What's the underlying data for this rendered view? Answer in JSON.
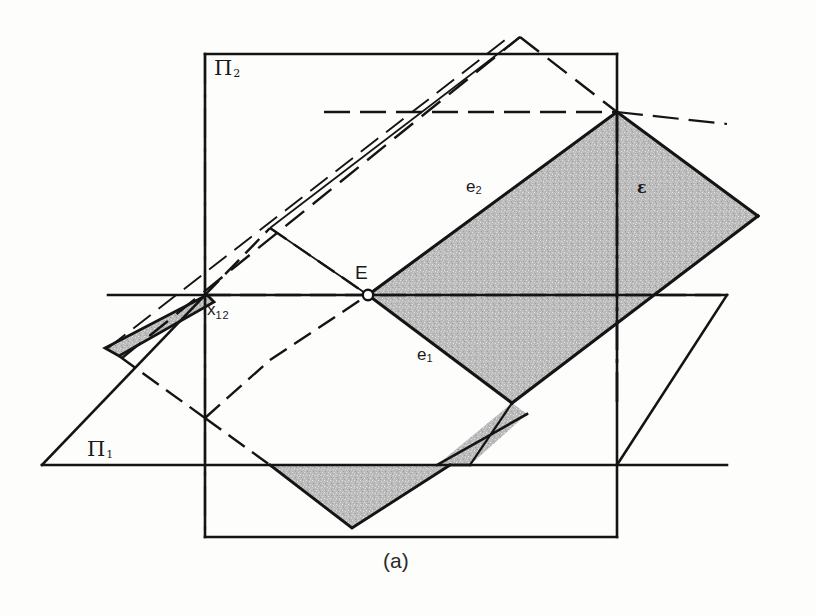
{
  "figure": {
    "caption": "(a)",
    "background_color": "#fdfdfc",
    "ink_color": "#141414",
    "shade_color": "#c9c9c9"
  },
  "labels": {
    "plane_pi2": {
      "base": "Π",
      "sub": "2"
    },
    "plane_pi1": {
      "base": "Π",
      "sub": "1"
    },
    "axis_x12": {
      "base": "x",
      "sub": "12"
    },
    "point_E": "E",
    "trace_e2": {
      "base": "e",
      "sub": "2"
    },
    "trace_e1": {
      "base": "e",
      "sub": "1"
    },
    "plane_epsilon": "ε"
  },
  "geometry": {
    "pi2_rectangle": {
      "x1": 205,
      "y1": 54,
      "x2": 617,
      "y2": 537
    },
    "pi1_horizontal_line": {
      "x1": 42,
      "y1": 465,
      "x2": 727,
      "y2": 465
    },
    "pi1_left_vertex": {
      "x": 42,
      "y": 465
    },
    "axis_x12_line": {
      "x1": 108,
      "y1": 295,
      "x2": 727,
      "y2": 295
    },
    "point_E_position": {
      "x": 368,
      "y": 295
    },
    "top_peak": {
      "x": 520,
      "y": 37
    },
    "epsilon_top_corner": {
      "x": 617,
      "y": 112
    },
    "epsilon_right_corner": {
      "x": 758,
      "y": 216
    },
    "epsilon_bottom_corner": {
      "x": 512,
      "y": 403
    },
    "epsilon_left_corner": {
      "x": 105,
      "y": 348
    },
    "bottom_triangle": {
      "left_x": 270,
      "right_x": 450,
      "top_y": 465,
      "apex_x": 352,
      "apex_y": 528
    },
    "dashed_lower_vertex": {
      "x": 205,
      "y": 418
    },
    "dashed_upper_vertex": {
      "x": 270,
      "y": 228
    }
  }
}
